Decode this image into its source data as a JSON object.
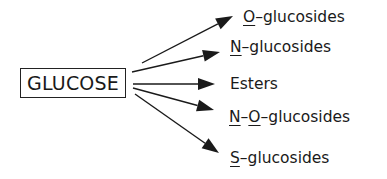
{
  "source": {
    "label": "GLUCOSE"
  },
  "products": [
    {
      "id": "o-glucosides",
      "parts": [
        {
          "t": "O",
          "u": true
        },
        {
          "t": "–glucosides",
          "u": false
        }
      ]
    },
    {
      "id": "n-glucosides",
      "parts": [
        {
          "t": "N",
          "u": true
        },
        {
          "t": "–glucosides",
          "u": false
        }
      ]
    },
    {
      "id": "esters",
      "parts": [
        {
          "t": "Esters",
          "u": false
        }
      ]
    },
    {
      "id": "n-o-glucosides",
      "parts": [
        {
          "t": "N",
          "u": true
        },
        {
          "t": "–",
          "u": false
        },
        {
          "t": "O",
          "u": true
        },
        {
          "t": "–glucosides",
          "u": false
        }
      ]
    },
    {
      "id": "s-glucosides",
      "parts": [
        {
          "t": "S",
          "u": true
        },
        {
          "t": "–glucosides",
          "u": false
        }
      ]
    }
  ],
  "colors": {
    "ink": "#1a1a1a"
  }
}
